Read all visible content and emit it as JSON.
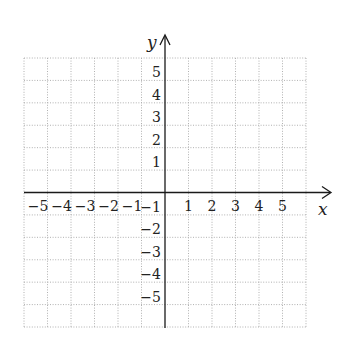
{
  "chart_data": {
    "type": "scatter",
    "title": "",
    "xlabel": "x",
    "ylabel": "y",
    "xlim": [
      -6,
      6
    ],
    "ylim": [
      -6,
      6
    ],
    "grid": true,
    "grid_style": "dotted",
    "x_ticks": [
      -5,
      -4,
      -3,
      -2,
      -1,
      1,
      2,
      3,
      4,
      5
    ],
    "y_ticks": [
      -5,
      -4,
      -3,
      -2,
      -1,
      1,
      2,
      3,
      4,
      5
    ],
    "x_tick_labels": [
      "−5",
      "−4",
      "−3",
      "−2",
      "−1",
      "1",
      "2",
      "3",
      "4",
      "5"
    ],
    "y_tick_labels": [
      "−5",
      "−4",
      "−3",
      "−2",
      "−1",
      "1",
      "2",
      "3",
      "4",
      "5"
    ],
    "series": []
  },
  "colors": {
    "axis": "#1a1a1a",
    "grid": "#a8a8a8",
    "text": "#222222",
    "background": "#ffffff"
  }
}
